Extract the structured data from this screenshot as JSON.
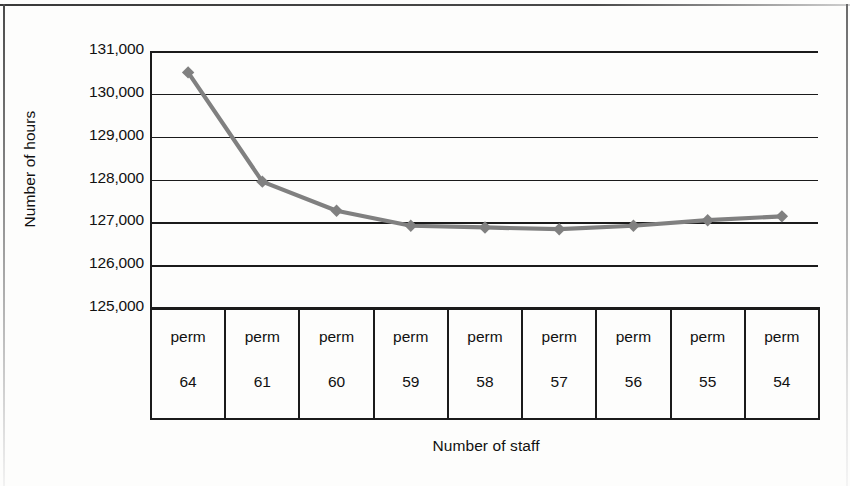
{
  "chart_data": {
    "type": "line",
    "title": "",
    "xlabel": "Number of staff",
    "ylabel": "Number of hours",
    "categories": [
      "perm\n64",
      "perm\n61",
      "perm\n60",
      "perm\n59",
      "perm\n58",
      "perm\n57",
      "perm\n56",
      "perm\n55",
      "perm\n54"
    ],
    "category_rows": [
      {
        "top": "perm",
        "bottom": "64"
      },
      {
        "top": "perm",
        "bottom": "61"
      },
      {
        "top": "perm",
        "bottom": "60"
      },
      {
        "top": "perm",
        "bottom": "59"
      },
      {
        "top": "perm",
        "bottom": "58"
      },
      {
        "top": "perm",
        "bottom": "57"
      },
      {
        "top": "perm",
        "bottom": "56"
      },
      {
        "top": "perm",
        "bottom": "55"
      },
      {
        "top": "perm",
        "bottom": "54"
      }
    ],
    "values": [
      130500,
      127950,
      127270,
      126920,
      126880,
      126840,
      126920,
      127050,
      127140
    ],
    "ylim": [
      125000,
      131000
    ],
    "yticks": [
      131000,
      130000,
      129000,
      128000,
      127000,
      126000,
      125000
    ],
    "ytick_labels": [
      "131,000",
      "130,000",
      "129,000",
      "128,000",
      "127,000",
      "126,000",
      "125,000"
    ],
    "grid": true,
    "legend": false,
    "series_color": "#808080",
    "marker": "diamond",
    "axis_color": "#1b1b1b"
  },
  "axes": {
    "y_title": "Number of hours",
    "x_title": "Number of staff"
  }
}
